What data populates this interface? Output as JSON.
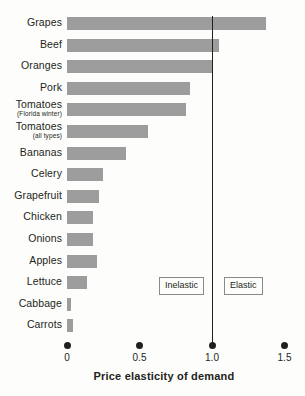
{
  "chart_data": {
    "type": "bar",
    "orientation": "horizontal",
    "title": "",
    "xlabel": "Price elasticity of demand",
    "ylabel": "",
    "xlim": [
      0,
      1.5
    ],
    "xticks": [
      "0",
      "0.5",
      "1.0",
      "1.5"
    ],
    "xtick_values": [
      0,
      0.5,
      1.0,
      1.5
    ],
    "grid": false,
    "legend": "none",
    "bar_color": "#9d9d9d",
    "reference_line": {
      "value": 1.0,
      "color": "#231f20",
      "label": "unit elastic"
    },
    "annotations": [
      {
        "text": "Inelastic",
        "x_range": [
          0,
          1.0
        ]
      },
      {
        "text": "Elastic",
        "x_range": [
          1.0,
          1.5
        ]
      }
    ],
    "categories": [
      "Grapes",
      "Beef",
      "Oranges",
      "Pork",
      "Tomatoes",
      "Tomatoes",
      "Bananas",
      "Celery",
      "Grapefruit",
      "Chicken",
      "Onions",
      "Apples",
      "Lettuce",
      "Cabbage",
      "Carrots"
    ],
    "category_sublabels": [
      "",
      "",
      "",
      "",
      "(Florida winter)",
      "(all types)",
      "",
      "",
      "",
      "",
      "",
      "",
      "",
      "",
      ""
    ],
    "values": [
      1.37,
      1.05,
      1.0,
      0.85,
      0.82,
      0.56,
      0.41,
      0.25,
      0.22,
      0.18,
      0.18,
      0.21,
      0.14,
      0.03,
      0.04
    ]
  },
  "axis": {
    "title": "Price elasticity of demand"
  },
  "callouts": {
    "inelastic": "Inelastic",
    "elastic": "Elastic"
  }
}
